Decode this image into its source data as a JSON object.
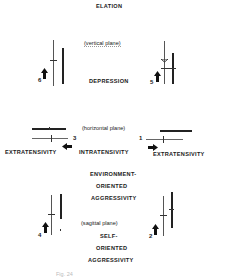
{
  "labels": {
    "elation": "ELATION",
    "vertical_plane": "(vertical plane)",
    "depression": "DEPRESSION",
    "horizontal_plane": "(horizontal plane)",
    "extratensivity_left": "EXTRATENSIVITY",
    "intratensivity": "INTRATENSIVITY",
    "extratensivity_right": "EXTRATENSIVITY",
    "env_line1": "ENVIRONMENT-",
    "env_line2": "ORIENTED",
    "env_line3": "AGGRESSIVITY",
    "sagittal_plane": "(sagittal plane)",
    "self_line1": "SELF-",
    "self_line2": "ORIENTED",
    "self_line3": "AGGRESSIVITY"
  },
  "figures": [
    {
      "id": "6",
      "plane": "vertical",
      "arrow": "up"
    },
    {
      "id": "5",
      "plane": "vertical",
      "arrow": "up"
    },
    {
      "id": "3",
      "plane": "horizontal",
      "arrow": "left"
    },
    {
      "id": "1",
      "plane": "horizontal",
      "arrow": "right"
    },
    {
      "id": "4",
      "plane": "sagittal",
      "arrow": "up"
    },
    {
      "id": "2",
      "plane": "sagittal",
      "arrow": "up"
    }
  ],
  "caption": "Fig. 24"
}
